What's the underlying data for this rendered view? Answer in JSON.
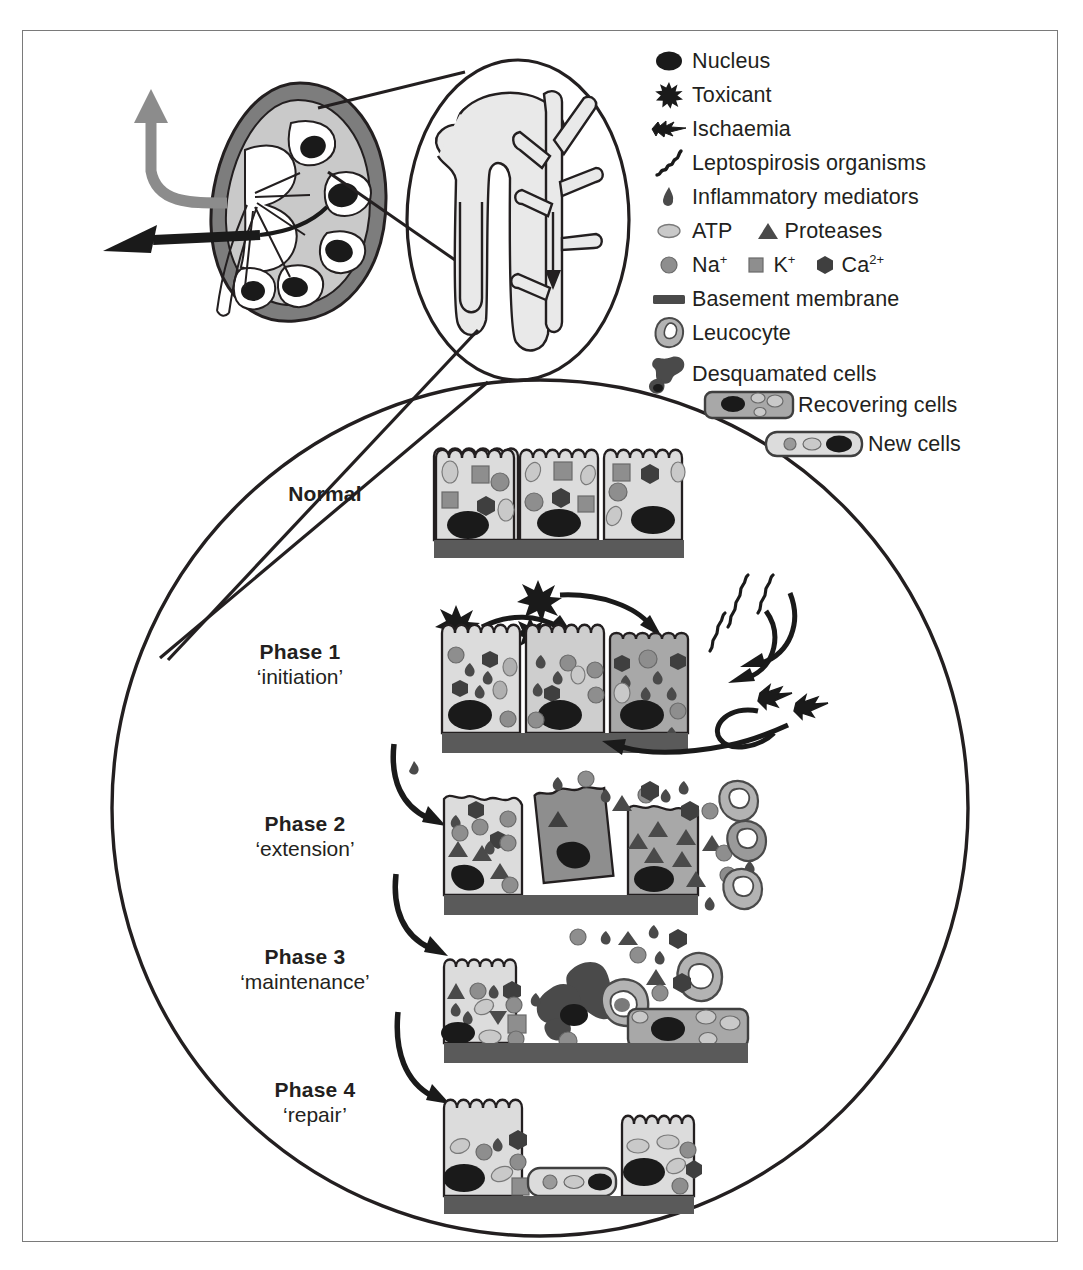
{
  "figure": {
    "type": "medical-diagram",
    "border_color": "#7a7a7a"
  },
  "colors": {
    "outline": "#231f20",
    "cytoplasm_light": "#dcdcdc",
    "cytoplasm_mid": "#b3b3b3",
    "cytoplasm_dark": "#8c8c8c",
    "nucleus": "#1a1a1a",
    "basement_membrane": "#5a5a5a",
    "organelle_mid": "#8e8e8e",
    "organelle_light": "#c9c9c9",
    "organelle_dark": "#4a4a4a",
    "kidney_cortex": "#7d7d7d",
    "kidney_inner": "#c9c9c9",
    "kidney_arrow_gray": "#8c8c8c",
    "white": "#ffffff"
  },
  "legend": {
    "items": [
      {
        "icon": "nucleus-icon",
        "label": "Nucleus"
      },
      {
        "icon": "toxicant-star-icon",
        "label": "Toxicant"
      },
      {
        "icon": "ischaemia-bolt-icon",
        "label": "Ischaemia"
      },
      {
        "icon": "leptospirosis-squiggle-icon",
        "label": "Leptospirosis organisms"
      },
      {
        "icon": "inflammatory-mediator-icon",
        "label": "Inflammatory mediators"
      }
    ],
    "row_atp_proteases": {
      "atp": {
        "icon": "atp-oval-icon",
        "label": "ATP"
      },
      "proteases": {
        "icon": "protease-triangle-icon",
        "label": "Proteases"
      }
    },
    "row_ions": {
      "na": {
        "icon": "sodium-circle-icon",
        "label": "Na",
        "sup": "+"
      },
      "k": {
        "icon": "potassium-square-icon",
        "label": "K",
        "sup": "+"
      },
      "ca": {
        "icon": "calcium-hexagon-icon",
        "label": "Ca",
        "sup": "2+"
      }
    },
    "items_lower": [
      {
        "icon": "basement-membrane-bar-icon",
        "label": "Basement membrane"
      },
      {
        "icon": "leucocyte-icon",
        "label": "Leucocyte"
      },
      {
        "icon": "desquamated-cells-icon",
        "label": "Desquamated cells"
      }
    ],
    "items_cells": [
      {
        "icon": "recovering-cell-icon",
        "label": "Recovering cells"
      },
      {
        "icon": "new-cell-icon",
        "label": "New cells"
      }
    ]
  },
  "stages": [
    {
      "id": "normal",
      "title": "Normal",
      "subtitle": ""
    },
    {
      "id": "phase1",
      "title": "Phase 1",
      "subtitle": "‘initiation’"
    },
    {
      "id": "phase2",
      "title": "Phase 2",
      "subtitle": "‘extension’"
    },
    {
      "id": "phase3",
      "title": "Phase 3",
      "subtitle": "‘maintenance’"
    },
    {
      "id": "phase4",
      "title": "Phase 4",
      "subtitle": "‘repair’"
    }
  ],
  "anatomy": {
    "kidney": "kidney-cross-section",
    "nephron": "nephron-detail-oval",
    "inflow_arrow": "renal-artery-inflow-arrow",
    "outflow_arrow": "ureter-outflow-arrow"
  }
}
